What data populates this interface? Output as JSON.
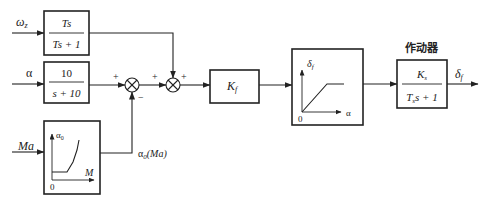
{
  "diagram": {
    "type": "control-block-diagram",
    "inputs": {
      "omega": {
        "label": "ω",
        "subscript": "z"
      },
      "alpha": {
        "label": "α"
      },
      "mach": {
        "label": "Ma"
      }
    },
    "blocks": {
      "washout": {
        "numerator": "Ts",
        "denominator": "Ts + 1"
      },
      "filter": {
        "numerator": "10",
        "denominator": "s + 10"
      },
      "gain": {
        "label": "K",
        "subscript": "f"
      },
      "schedule": {
        "y_axis": "α",
        "y_sub": "0",
        "x_axis": "M",
        "origin": "0"
      },
      "saturation": {
        "y_axis": "δ",
        "y_sub": "f",
        "x_axis": "α",
        "origin": "0"
      },
      "actuator": {
        "title": "作动器",
        "numerator": "K",
        "numerator_sub": "s",
        "denominator_pre": "T",
        "denominator_sub": "s",
        "denominator_post": "s + 1"
      }
    },
    "junctions": {
      "sum1": {
        "top_sign": "+",
        "bottom_sign": "−"
      },
      "sum2": {
        "left_sign": "+",
        "right_sign": "+"
      }
    },
    "signals": {
      "feedback_label": "α",
      "feedback_sub": "0",
      "feedback_arg": "(Ma)",
      "output": {
        "label": "δ",
        "subscript": "f"
      }
    }
  }
}
